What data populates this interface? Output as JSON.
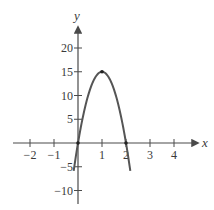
{
  "chart_data": {
    "type": "line",
    "title": "",
    "xlabel": "x",
    "ylabel": "y",
    "xlim": [
      -2.7,
      5.0
    ],
    "ylim": [
      -12.7,
      26.5
    ],
    "grid": false,
    "legend": null,
    "x_ticks": [
      -2,
      -1,
      1,
      2,
      3,
      4
    ],
    "x_tick_labels": [
      "−2",
      "−1",
      "1",
      "2",
      "3",
      "4"
    ],
    "y_ticks": [
      -10,
      -5,
      5,
      10,
      15,
      20
    ],
    "y_tick_labels": [
      "−10",
      "−5",
      "5",
      "10",
      "15",
      "20"
    ],
    "series": [
      {
        "name": "y = 30x − 15x²",
        "function": "-15*(x-1)^2 + 15",
        "x_range": [
          -0.18,
          2.18
        ],
        "x": [
          -0.18,
          0,
          0.25,
          0.5,
          0.75,
          1,
          1.25,
          1.5,
          1.75,
          2,
          2.18
        ],
        "values": [
          -5.9,
          0,
          6.56,
          11.25,
          14.06,
          15,
          14.06,
          11.25,
          6.56,
          0,
          -5.9
        ],
        "color": "#555555"
      }
    ],
    "annotations": [
      {
        "type": "point",
        "x": 0,
        "y": 0,
        "label": ""
      },
      {
        "type": "point",
        "x": 1,
        "y": 15,
        "label": "vertex"
      },
      {
        "type": "point",
        "x": 2,
        "y": 0,
        "label": ""
      }
    ]
  },
  "colors": {
    "axis": "#4a4a4a",
    "curve": "#555555",
    "text": "#3a3a3a",
    "background": "#ffffff"
  }
}
